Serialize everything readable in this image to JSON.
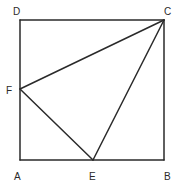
{
  "figure": {
    "type": "geometry",
    "points": {
      "A": {
        "label": "A",
        "x": 20,
        "y": 160,
        "label_x": 14,
        "label_y": 180
      },
      "B": {
        "label": "B",
        "x": 164,
        "y": 160,
        "label_x": 164,
        "label_y": 180
      },
      "C": {
        "label": "C",
        "x": 164,
        "y": 20,
        "label_x": 164,
        "label_y": 15
      },
      "D": {
        "label": "D",
        "x": 20,
        "y": 20,
        "label_x": 13,
        "label_y": 15
      },
      "E": {
        "label": "E",
        "x": 93,
        "y": 160,
        "label_x": 89,
        "label_y": 180
      },
      "F": {
        "label": "F",
        "x": 20,
        "y": 89,
        "label_x": 6,
        "label_y": 94
      }
    },
    "segments": [
      [
        "A",
        "B"
      ],
      [
        "B",
        "C"
      ],
      [
        "C",
        "D"
      ],
      [
        "D",
        "A"
      ],
      [
        "C",
        "F"
      ],
      [
        "C",
        "E"
      ],
      [
        "E",
        "F"
      ]
    ],
    "line_color": "#2a2a2a"
  }
}
